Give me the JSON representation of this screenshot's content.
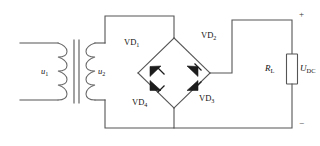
{
  "figure": {
    "type": "circuit-schematic",
    "name": "single-phase full-wave bridge rectifier",
    "line_color": "#555555",
    "diode_color": "#1c1c1c",
    "background_color": "#ffffff"
  },
  "transformer": {
    "primary": {
      "label_main": "u",
      "label_sub": "1"
    },
    "secondary": {
      "label_main": "u",
      "label_sub": "2"
    }
  },
  "bridge": {
    "diodes": [
      {
        "id": "VD1",
        "label_main": "VD",
        "label_sub": "1",
        "arm": "upper-left",
        "direction": "toward-top-node"
      },
      {
        "id": "VD2",
        "label_main": "VD",
        "label_sub": "2",
        "arm": "upper-right",
        "direction": "toward-right-node"
      },
      {
        "id": "VD3",
        "label_main": "VD",
        "label_sub": "3",
        "arm": "lower-right",
        "direction": "toward-right-node"
      },
      {
        "id": "VD4",
        "label_main": "VD",
        "label_sub": "4",
        "arm": "lower-left",
        "direction": "toward-bottom-node"
      }
    ]
  },
  "load": {
    "resistor_main": "R",
    "resistor_sub": "L",
    "voltage_main": "U",
    "voltage_sub": "DC"
  },
  "terminals": {
    "positive": "+",
    "negative": "−"
  }
}
